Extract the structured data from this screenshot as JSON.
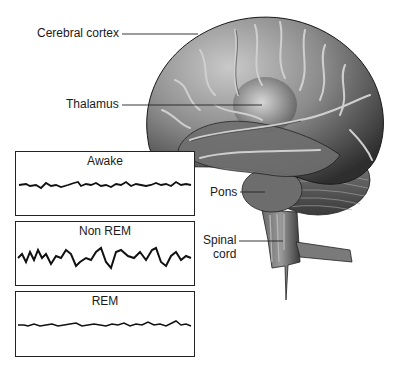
{
  "figure": {
    "labels": {
      "cerebral_cortex": "Cerebral cortex",
      "thalamus": "Thalamus",
      "pons": "Pons",
      "spinal_cord_line1": "Spinal",
      "spinal_cord_line2": "cord"
    },
    "eeg_panels": [
      {
        "title": "Awake",
        "pattern": "low-amplitude fast"
      },
      {
        "title": "Non REM",
        "pattern": "high-amplitude slow"
      },
      {
        "title": "REM",
        "pattern": "low-amplitude fast"
      }
    ],
    "colors": {
      "brain_dark": "#3a3a3a",
      "brain_mid": "#7a7a7a",
      "brain_light": "#c8c8c8",
      "line": "#1a1a1a"
    }
  }
}
